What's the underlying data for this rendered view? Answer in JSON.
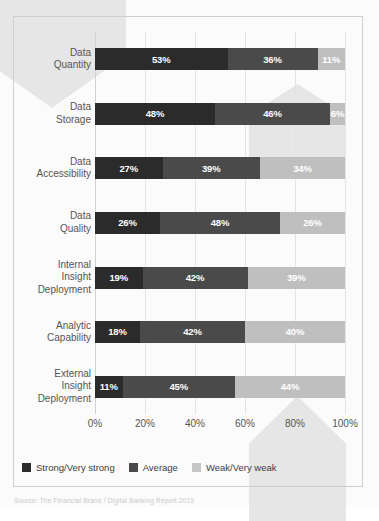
{
  "chart_data": {
    "type": "bar",
    "subtype": "stacked-horizontal-100",
    "title": "",
    "subtitle": "",
    "xlabel": "",
    "ylabel": "",
    "xlim": [
      0,
      100
    ],
    "grid": true,
    "legend_position": "bottom-left",
    "categories": [
      "Data Quantity",
      "Data Storage",
      "Data Accessibility",
      "Data Quality",
      "Internal Insight Deployment",
      "Analytic Capability",
      "External Insight Deployment"
    ],
    "category_lines": [
      [
        "Data",
        "Quantity"
      ],
      [
        "Data",
        "Storage"
      ],
      [
        "Data",
        "Accessibility"
      ],
      [
        "Data",
        "Quality"
      ],
      [
        "Internal",
        "Insight",
        "Deployment"
      ],
      [
        "Analytic",
        "Capability"
      ],
      [
        "External",
        "Insight",
        "Deployment"
      ]
    ],
    "series": [
      {
        "name": "Strong/Very strong",
        "color": "#2b2b2b",
        "values": [
          53,
          48,
          27,
          26,
          19,
          18,
          11
        ]
      },
      {
        "name": "Average",
        "color": "#4a4a4a",
        "values": [
          36,
          46,
          39,
          48,
          42,
          42,
          45
        ]
      },
      {
        "name": "Weak/Very weak",
        "color": "#bfbfbf",
        "values": [
          11,
          6,
          34,
          26,
          39,
          40,
          44
        ]
      }
    ],
    "value_labels": [
      [
        "53%",
        "36%",
        "11%"
      ],
      [
        "48%",
        "46%",
        "6%"
      ],
      [
        "27%",
        "39%",
        "34%"
      ],
      [
        "26%",
        "48%",
        "26%"
      ],
      [
        "19%",
        "42%",
        "39%"
      ],
      [
        "18%",
        "42%",
        "40%"
      ],
      [
        "11%",
        "45%",
        "44%"
      ]
    ],
    "xticks": [
      0,
      20,
      40,
      60,
      80,
      100
    ],
    "xtick_labels": [
      "0%",
      "20%",
      "40%",
      "60%",
      "80%",
      "100%"
    ]
  },
  "legend": {
    "items": [
      {
        "label": "Strong/Very strong",
        "swatch": "strong"
      },
      {
        "label": "Average",
        "swatch": "average"
      },
      {
        "label": "Weak/Very weak",
        "swatch": "weak"
      }
    ]
  },
  "source": {
    "text": "Source: The Financial Brand / Digital Banking Report 2019"
  },
  "colors": {
    "strong": "#2b2b2b",
    "average": "#4a4a4a",
    "weak": "#bfbfbf",
    "gridline": "#e3e3e3",
    "frame": "#cfcfcf",
    "watermark": "#e6e6e6",
    "label_text": "#555555",
    "value_text": "#ffffff"
  }
}
